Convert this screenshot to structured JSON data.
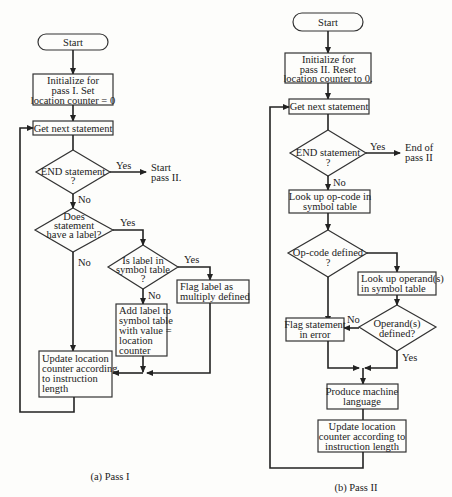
{
  "pass1": {
    "caption": "(a) Pass I",
    "start": "Start",
    "init": [
      "Initialize for",
      "pass I. Set",
      "location counter = 0"
    ],
    "get_next": "Get next statement",
    "end_decision": [
      "END statement",
      "?"
    ],
    "end_yes_label": "Yes",
    "end_yes_target": [
      "Start",
      "pass II."
    ],
    "end_no_label": "No",
    "label_decision": [
      "Does",
      "statement",
      "have a label?"
    ],
    "label_yes_label": "Yes",
    "label_no_label": "No",
    "in_table_decision": [
      "Is label in",
      "symbol table",
      "?"
    ],
    "in_table_yes_label": "Yes",
    "in_table_no_label": "No",
    "flag_multiply": [
      "Flag label as",
      "multiply defined"
    ],
    "add_label": [
      "Add label to",
      "symbol table",
      "with value =",
      "location",
      "counter"
    ],
    "update": [
      "Update location",
      "counter according",
      "to instruction",
      "length"
    ]
  },
  "pass2": {
    "caption": "(b) Pass II",
    "start": "Start",
    "init": [
      "Initialize for",
      "pass II. Reset",
      "location counter to 0."
    ],
    "get_next": "Get next statement",
    "end_decision": [
      "END statement",
      "?"
    ],
    "end_yes_label": "Yes",
    "end_yes_target": [
      "End of",
      "pass II"
    ],
    "end_no_label": "No",
    "lookup_opcode": [
      "Look up op-code in",
      "symbol table"
    ],
    "opcode_decision": [
      "Op-code defined",
      "?"
    ],
    "lookup_operands": [
      "Look up operand(s)",
      "in symbol table"
    ],
    "operands_decision": [
      "Operand(s)",
      "defined?"
    ],
    "operands_no_label": "No",
    "operands_yes_label": "Yes",
    "flag_error": [
      "Flag statement",
      "in error"
    ],
    "produce": [
      "Produce machine",
      "language"
    ],
    "update": [
      "Update location",
      "counter according to",
      "instruction length"
    ]
  }
}
